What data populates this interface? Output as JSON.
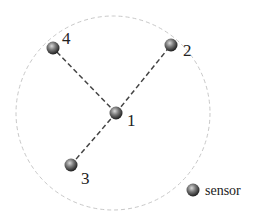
{
  "diagram": {
    "type": "sensor-network-topology",
    "range_circle": {
      "cx": 113,
      "cy": 113,
      "r": 97,
      "color": "#c8c8c8",
      "style": "dashed"
    },
    "nodes": [
      {
        "id": "1",
        "label": "1",
        "x": 116,
        "y": 113,
        "label_x": 127,
        "label_y": 126
      },
      {
        "id": "2",
        "label": "2",
        "x": 171,
        "y": 45,
        "label_x": 183,
        "label_y": 56
      },
      {
        "id": "3",
        "label": "3",
        "x": 71,
        "y": 165,
        "label_x": 81,
        "label_y": 184
      },
      {
        "id": "4",
        "label": "4",
        "x": 53,
        "y": 48,
        "label_x": 62,
        "label_y": 44
      }
    ],
    "edges": [
      {
        "from": "1",
        "to": "2"
      },
      {
        "from": "1",
        "to": "3"
      },
      {
        "from": "1",
        "to": "4"
      }
    ],
    "edge_style": {
      "color": "#444444",
      "dash": "5,3"
    },
    "node_color": "#555555"
  },
  "legend": {
    "marker": "sensor-icon",
    "label": "sensor"
  }
}
